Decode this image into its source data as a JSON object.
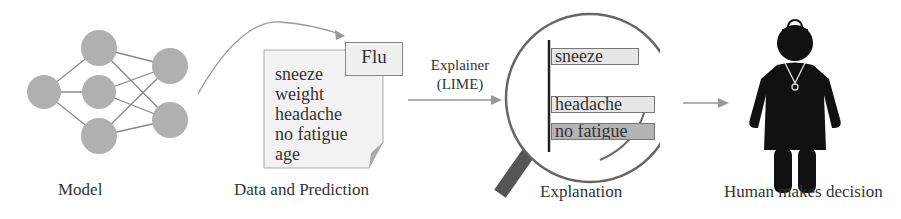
{
  "stages": {
    "model": {
      "caption": "Model"
    },
    "data": {
      "caption": "Data and Prediction",
      "prediction": "Flu",
      "features": [
        "sneeze",
        "weight",
        "headache",
        "no fatigue",
        "age"
      ]
    },
    "explainer": {
      "label_line1": "Explainer",
      "label_line2": "(LIME)"
    },
    "explanation": {
      "caption": "Explanation",
      "bars": [
        {
          "label": "sneeze",
          "color": "#e6e6e6"
        },
        {
          "label": "headache",
          "color": "#e6e6e6"
        },
        {
          "label": "no fatigue",
          "color": "#b4b4b4"
        }
      ]
    },
    "human": {
      "caption": "Human makes decision"
    }
  },
  "colors": {
    "node_fill": "#b0b0b0",
    "line": "#888888",
    "arrow": "#999999",
    "doctor": "#111111",
    "magnifier_handle": "#555555"
  }
}
